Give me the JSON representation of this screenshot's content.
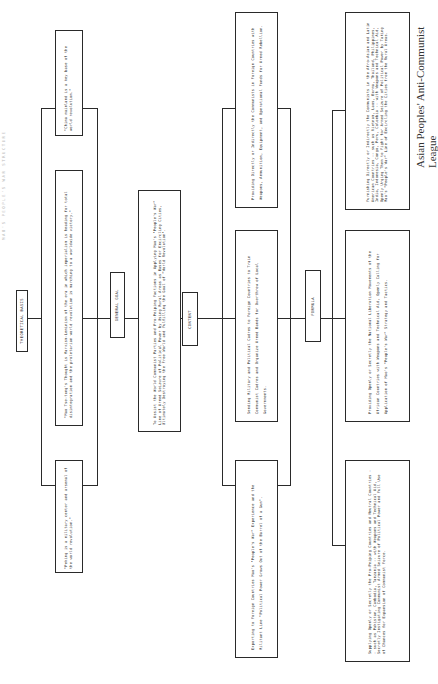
{
  "title_faint": "MAO'S PEOPLE'S WAR STRUCTURE",
  "theoretical_basis": {
    "label": "THEORETICAL BASIS",
    "quotes": [
      "\"China mainland is a key base of the world revolution.\"",
      "\"Mao Tse-tung's Thought is Marxism-Leninism of the era in which imperialism is heading for total disintegration and the proletarian world revolution is marching to a worldwide victory.\"",
      "\"Peking is a military center and arsenal of the world revolution.\""
    ]
  },
  "general_goal": {
    "label": "GENERAL GOAL",
    "text": "To Assist the World Communist Parties and Pro-Peiping Factions in Applying Mao's \"People's War\" Line of Armed Seizure of Political Power by Using Rural Areas as Bases for Encircling Cities, Ultimately Destroying the Free World and Fulfilling the Goal of \"World Revolution\"."
  },
  "content": {
    "label": "CONTENT",
    "items": [
      "Providing Directly or Indirectly the Communists in Foreign Countries with Weapons, Ammunition, Equipment, and Operational Funds for Armed Rebellion.",
      "Sending Military and Political Cadres to Foreign Countries to Train Communist Cadres and Organize Armed Bands for Overthrow of Local Governments.",
      "Exporting to Foreign Countries Mao's \"People's War\" Experience and the Militant Line \"Political Power Grows Out of the Barrel of a Gun\"."
    ]
  },
  "formula": {
    "label": "FORMULA",
    "items": [
      "Furnishing Directly or Indirectly the Communists in the Afro-Asian and Latin American Countries -- such as Vietnam, Laos, Burma, Thailand, Philippines, India, Indonesia, Congo, Peru, Colombia -- with Weapons and Technical Aid, Openly Urging Them to Fight for Armed Seizure of Political Power by Taking Mao's \"People's War\" Line of Encircling the Cities from the Rural Areas.",
      "Providing Openly or Secretly the National Liberation Movements of the African Countries with Weapons and Technical Aid, Openly Calling for Application of Mao's \"People's War\" Strategy and Tactics.",
      "Supplying Openly or Secretly the Pro-Peiping Countries and Neutral Countries -- such as Pakistan, Cambodia, Tanzania -- with Weapons and Technical Aid, Secretly Instigating Communist Armed Seizure of Political Power and Full Use of Chances for Expansion of Communist Force."
    ]
  },
  "source": "Asian Peoples' Anti-Communist League"
}
